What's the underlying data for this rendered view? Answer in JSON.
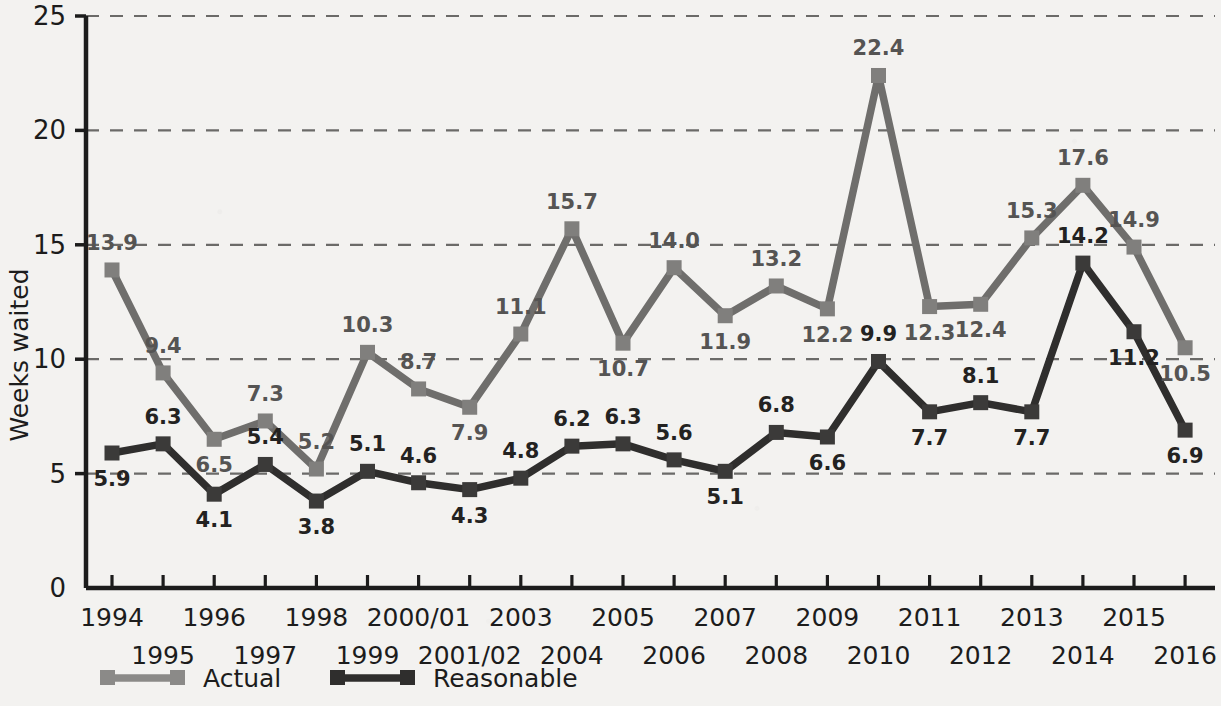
{
  "chart_data": {
    "type": "line",
    "title": "",
    "xlabel": "",
    "ylabel": "Weeks waited",
    "ylim": [
      0,
      25
    ],
    "yticks": [
      0,
      5,
      10,
      15,
      20,
      25
    ],
    "grid": true,
    "grid_style": "dashed-horizontal",
    "legend_position": "bottom-left",
    "categories": [
      "1994",
      "1995",
      "1996",
      "1997",
      "1998",
      "1999",
      "2000/01",
      "2001/02",
      "2003",
      "2004",
      "2005",
      "2006",
      "2007",
      "2008",
      "2009",
      "2010",
      "2011",
      "2012",
      "2013",
      "2014",
      "2015",
      "2016"
    ],
    "series": [
      {
        "name": "Actual",
        "color": "#6f6e6c",
        "values": [
          13.9,
          9.4,
          6.5,
          7.3,
          5.2,
          10.3,
          8.7,
          7.9,
          11.1,
          15.7,
          10.7,
          14.0,
          11.9,
          13.2,
          12.2,
          22.4,
          12.3,
          12.4,
          15.3,
          17.6,
          14.9,
          10.5
        ],
        "label_offsets": [
          "above",
          "above",
          "below",
          "above",
          "above",
          "above",
          "above",
          "below",
          "above",
          "above",
          "below",
          "above",
          "below",
          "above",
          "below",
          "above",
          "below",
          "below",
          "above",
          "above",
          "above",
          "below"
        ]
      },
      {
        "name": "Reasonable",
        "color": "#2f2e2d",
        "values": [
          5.9,
          6.3,
          4.1,
          5.4,
          3.8,
          5.1,
          4.6,
          4.3,
          4.8,
          6.2,
          6.3,
          5.6,
          5.1,
          6.8,
          6.6,
          9.9,
          7.7,
          8.1,
          7.7,
          14.2,
          11.2,
          6.9
        ],
        "label_offsets": [
          "below",
          "above",
          "below",
          "above",
          "below",
          "above",
          "above",
          "below",
          "above",
          "above",
          "above",
          "above",
          "below",
          "above",
          "below",
          "above",
          "below",
          "above",
          "below",
          "above",
          "below",
          "below"
        ]
      }
    ]
  },
  "axis": {
    "y_label": "Weeks waited",
    "y_ticks": [
      "0",
      "5",
      "10",
      "15",
      "20",
      "25"
    ],
    "x_ticks_row_top": [
      "1994",
      "1996",
      "1998",
      "2000/01",
      "2003",
      "2005",
      "2007",
      "2009",
      "2011",
      "2013",
      "2015"
    ],
    "x_ticks_row_bottom": [
      "1995",
      "1997",
      "1999",
      "2001/02",
      "2004",
      "2006",
      "2008",
      "2010",
      "2012",
      "2014",
      "2016"
    ]
  },
  "legend": {
    "items": [
      {
        "label": "Actual",
        "color": "#8b8a88"
      },
      {
        "label": "Reasonable",
        "color": "#2f2e2d"
      }
    ]
  },
  "colors": {
    "background": "#f3f2f0",
    "axis": "#1c1c1c",
    "grid": "#6b6a68",
    "actual": "#6f6e6c",
    "actual_marker": "#807f7d",
    "reasonable": "#2f2e2d",
    "reasonable_marker": "#3b3a39"
  }
}
